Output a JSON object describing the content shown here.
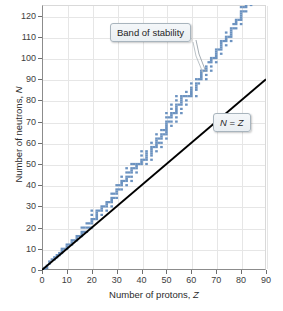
{
  "chart_data": {
    "type": "scatter",
    "title": "",
    "xlabel": "Number of protons, Z",
    "ylabel": "Number of neutrons, N",
    "xlim": [
      0,
      90
    ],
    "ylim": [
      0,
      125
    ],
    "xticks": [
      0,
      10,
      20,
      30,
      40,
      50,
      60,
      70,
      80,
      90
    ],
    "yticks": [
      0,
      10,
      20,
      30,
      40,
      50,
      60,
      70,
      80,
      90,
      100,
      110,
      120
    ],
    "grid": true,
    "legend_position": "none",
    "annotations": [
      {
        "label": "Band of stability",
        "points_to": [
          63,
          92
        ]
      },
      {
        "label": "N = Z",
        "points_to": null
      }
    ],
    "series": [
      {
        "name": "Band of stability",
        "type": "scatter",
        "color": "#6b92c0",
        "description": "Stable nuclides: number of neutrons N plotted against number of protons Z. Band follows N=Z at low Z then curves above it, ending near Z=83, N=126.",
        "points": [
          [
            1,
            0
          ],
          [
            1,
            1
          ],
          [
            2,
            1
          ],
          [
            2,
            2
          ],
          [
            3,
            3
          ],
          [
            3,
            4
          ],
          [
            4,
            5
          ],
          [
            5,
            5
          ],
          [
            5,
            6
          ],
          [
            6,
            6
          ],
          [
            6,
            7
          ],
          [
            7,
            7
          ],
          [
            7,
            8
          ],
          [
            8,
            8
          ],
          [
            8,
            9
          ],
          [
            8,
            10
          ],
          [
            9,
            10
          ],
          [
            10,
            10
          ],
          [
            10,
            11
          ],
          [
            10,
            12
          ],
          [
            11,
            12
          ],
          [
            12,
            12
          ],
          [
            12,
            13
          ],
          [
            12,
            14
          ],
          [
            13,
            14
          ],
          [
            14,
            14
          ],
          [
            14,
            15
          ],
          [
            14,
            16
          ],
          [
            15,
            16
          ],
          [
            16,
            16
          ],
          [
            16,
            17
          ],
          [
            16,
            18
          ],
          [
            16,
            20
          ],
          [
            17,
            18
          ],
          [
            17,
            20
          ],
          [
            18,
            18
          ],
          [
            18,
            20
          ],
          [
            18,
            22
          ],
          [
            19,
            20
          ],
          [
            19,
            22
          ],
          [
            20,
            20
          ],
          [
            20,
            22
          ],
          [
            20,
            23
          ],
          [
            20,
            24
          ],
          [
            20,
            26
          ],
          [
            20,
            28
          ],
          [
            21,
            24
          ],
          [
            22,
            24
          ],
          [
            22,
            25
          ],
          [
            22,
            26
          ],
          [
            22,
            27
          ],
          [
            22,
            28
          ],
          [
            23,
            28
          ],
          [
            24,
            26
          ],
          [
            24,
            28
          ],
          [
            24,
            29
          ],
          [
            24,
            30
          ],
          [
            25,
            30
          ],
          [
            26,
            28
          ],
          [
            26,
            30
          ],
          [
            26,
            31
          ],
          [
            26,
            32
          ],
          [
            27,
            32
          ],
          [
            28,
            30
          ],
          [
            28,
            32
          ],
          [
            28,
            33
          ],
          [
            28,
            34
          ],
          [
            28,
            36
          ],
          [
            29,
            34
          ],
          [
            29,
            36
          ],
          [
            30,
            34
          ],
          [
            30,
            36
          ],
          [
            30,
            37
          ],
          [
            30,
            38
          ],
          [
            30,
            40
          ],
          [
            31,
            38
          ],
          [
            31,
            40
          ],
          [
            32,
            38
          ],
          [
            32,
            40
          ],
          [
            32,
            41
          ],
          [
            32,
            42
          ],
          [
            32,
            44
          ],
          [
            33,
            42
          ],
          [
            34,
            40
          ],
          [
            34,
            42
          ],
          [
            34,
            43
          ],
          [
            34,
            44
          ],
          [
            34,
            46
          ],
          [
            34,
            48
          ],
          [
            35,
            44
          ],
          [
            35,
            46
          ],
          [
            36,
            42
          ],
          [
            36,
            44
          ],
          [
            36,
            46
          ],
          [
            36,
            47
          ],
          [
            36,
            48
          ],
          [
            36,
            50
          ],
          [
            37,
            48
          ],
          [
            37,
            50
          ],
          [
            38,
            46
          ],
          [
            38,
            48
          ],
          [
            38,
            49
          ],
          [
            38,
            50
          ],
          [
            39,
            50
          ],
          [
            40,
            50
          ],
          [
            40,
            51
          ],
          [
            40,
            52
          ],
          [
            40,
            54
          ],
          [
            40,
            56
          ],
          [
            41,
            52
          ],
          [
            42,
            50
          ],
          [
            42,
            52
          ],
          [
            42,
            53
          ],
          [
            42,
            54
          ],
          [
            42,
            55
          ],
          [
            42,
            56
          ],
          [
            44,
            52
          ],
          [
            44,
            54
          ],
          [
            44,
            55
          ],
          [
            44,
            56
          ],
          [
            44,
            57
          ],
          [
            44,
            58
          ],
          [
            44,
            60
          ],
          [
            45,
            58
          ],
          [
            46,
            56
          ],
          [
            46,
            58
          ],
          [
            46,
            59
          ],
          [
            46,
            60
          ],
          [
            46,
            61
          ],
          [
            46,
            62
          ],
          [
            46,
            64
          ],
          [
            47,
            60
          ],
          [
            47,
            62
          ],
          [
            48,
            58
          ],
          [
            48,
            60
          ],
          [
            48,
            62
          ],
          [
            48,
            63
          ],
          [
            48,
            64
          ],
          [
            48,
            66
          ],
          [
            49,
            64
          ],
          [
            49,
            66
          ],
          [
            50,
            62
          ],
          [
            50,
            64
          ],
          [
            50,
            65
          ],
          [
            50,
            66
          ],
          [
            50,
            67
          ],
          [
            50,
            68
          ],
          [
            50,
            69
          ],
          [
            50,
            70
          ],
          [
            50,
            72
          ],
          [
            50,
            74
          ],
          [
            51,
            70
          ],
          [
            51,
            72
          ],
          [
            52,
            68
          ],
          [
            52,
            70
          ],
          [
            52,
            72
          ],
          [
            52,
            73
          ],
          [
            52,
            74
          ],
          [
            52,
            76
          ],
          [
            52,
            78
          ],
          [
            53,
            74
          ],
          [
            54,
            70
          ],
          [
            54,
            72
          ],
          [
            54,
            74
          ],
          [
            54,
            75
          ],
          [
            54,
            76
          ],
          [
            54,
            77
          ],
          [
            54,
            78
          ],
          [
            54,
            80
          ],
          [
            54,
            82
          ],
          [
            55,
            78
          ],
          [
            56,
            74
          ],
          [
            56,
            76
          ],
          [
            56,
            78
          ],
          [
            56,
            79
          ],
          [
            56,
            80
          ],
          [
            56,
            81
          ],
          [
            56,
            82
          ],
          [
            57,
            82
          ],
          [
            58,
            78
          ],
          [
            58,
            80
          ],
          [
            58,
            82
          ],
          [
            58,
            84
          ],
          [
            59,
            82
          ],
          [
            60,
            82
          ],
          [
            60,
            83
          ],
          [
            60,
            84
          ],
          [
            60,
            85
          ],
          [
            60,
            86
          ],
          [
            60,
            88
          ],
          [
            62,
            82
          ],
          [
            62,
            85
          ],
          [
            62,
            86
          ],
          [
            62,
            87
          ],
          [
            62,
            88
          ],
          [
            62,
            90
          ],
          [
            63,
            88
          ],
          [
            63,
            90
          ],
          [
            64,
            90
          ],
          [
            64,
            91
          ],
          [
            64,
            92
          ],
          [
            64,
            93
          ],
          [
            64,
            94
          ],
          [
            65,
            94
          ],
          [
            66,
            90
          ],
          [
            66,
            92
          ],
          [
            66,
            94
          ],
          [
            66,
            95
          ],
          [
            66,
            96
          ],
          [
            67,
            98
          ],
          [
            68,
            94
          ],
          [
            68,
            96
          ],
          [
            68,
            98
          ],
          [
            68,
            99
          ],
          [
            68,
            100
          ],
          [
            69,
            100
          ],
          [
            70,
            98
          ],
          [
            70,
            100
          ],
          [
            70,
            101
          ],
          [
            70,
            102
          ],
          [
            70,
            103
          ],
          [
            70,
            104
          ],
          [
            71,
            104
          ],
          [
            72,
            102
          ],
          [
            72,
            104
          ],
          [
            72,
            105
          ],
          [
            72,
            106
          ],
          [
            72,
            107
          ],
          [
            72,
            108
          ],
          [
            73,
            108
          ],
          [
            74,
            106
          ],
          [
            74,
            108
          ],
          [
            74,
            109
          ],
          [
            74,
            110
          ],
          [
            74,
            112
          ],
          [
            75,
            110
          ],
          [
            76,
            108
          ],
          [
            76,
            110
          ],
          [
            76,
            111
          ],
          [
            76,
            112
          ],
          [
            76,
            113
          ],
          [
            76,
            114
          ],
          [
            77,
            114
          ],
          [
            77,
            116
          ],
          [
            78,
            114
          ],
          [
            78,
            116
          ],
          [
            78,
            117
          ],
          [
            78,
            118
          ],
          [
            79,
            118
          ],
          [
            80,
            116
          ],
          [
            80,
            118
          ],
          [
            80,
            119
          ],
          [
            80,
            120
          ],
          [
            80,
            121
          ],
          [
            80,
            122
          ],
          [
            80,
            124
          ],
          [
            81,
            122
          ],
          [
            81,
            124
          ],
          [
            82,
            122
          ],
          [
            82,
            124
          ],
          [
            82,
            125
          ],
          [
            82,
            126
          ],
          [
            83,
            126
          ],
          [
            84,
            125
          ]
        ]
      },
      {
        "name": "N = Z",
        "type": "line",
        "color": "#000000",
        "x": [
          0,
          90
        ],
        "y": [
          0,
          90
        ]
      }
    ]
  },
  "annotations": {
    "band_label": "Band of stability",
    "nz_label_n": "N",
    "nz_label_eq": " = ",
    "nz_label_z": "Z"
  },
  "axes": {
    "x_title_prefix": "Number of protons, ",
    "x_title_symbol": "Z",
    "y_title_prefix": "Number of neutrons, ",
    "y_title_symbol": "N"
  },
  "colors": {
    "band": "#6b92c0",
    "band_light": "#a9c3de",
    "line": "#000000",
    "grid": "#e6e6e6",
    "axis": "#8c8c8c",
    "callout_border": "#a8b4bd"
  }
}
